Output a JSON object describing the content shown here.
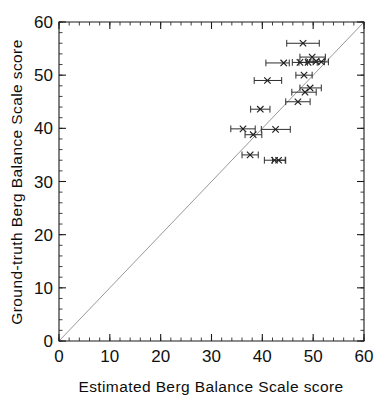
{
  "figure": {
    "background_color": "#ffffff",
    "frame_color": "#1a1a1a",
    "identity_line_color": "#8c8c8c",
    "marker_color": "#1f1f1f",
    "errorbar_color": "#2e2e2e"
  },
  "chart_data": {
    "type": "scatter",
    "title": "",
    "xlabel": "Estimated Berg Balance Scale score",
    "ylabel": "Ground-truth Berg Balance Scale score",
    "xlim": [
      0,
      60
    ],
    "ylim": [
      0,
      60
    ],
    "xticks": [
      0,
      10,
      20,
      30,
      40,
      50,
      60
    ],
    "yticks": [
      0,
      10,
      20,
      30,
      40,
      50,
      60
    ],
    "xtick_labels": [
      "0",
      "10",
      "20",
      "30",
      "40",
      "50",
      "60"
    ],
    "ytick_labels": [
      "0",
      "10",
      "20",
      "30",
      "40",
      "50",
      "60"
    ],
    "minor_tick_interval": 2,
    "grid": false,
    "legend": null,
    "reference_line": {
      "name": "identity-line",
      "type": "line",
      "from": [
        0,
        0
      ],
      "to": [
        60,
        60
      ],
      "label": "y = x"
    },
    "error_bar_orientation": "horizontal",
    "series": [
      {
        "name": "participants",
        "marker": "x",
        "points": [
          {
            "x": 48.0,
            "y": 56.0,
            "xerr_low": 3.2,
            "xerr_high": 3.2
          },
          {
            "x": 49.8,
            "y": 53.4,
            "xerr_low": 2.4,
            "xerr_high": 2.6
          },
          {
            "x": 50.6,
            "y": 52.6,
            "xerr_low": 2.0,
            "xerr_high": 1.6
          },
          {
            "x": 51.6,
            "y": 52.5,
            "xerr_low": 1.6,
            "xerr_high": 1.4
          },
          {
            "x": 49.0,
            "y": 52.4,
            "xerr_low": 1.8,
            "xerr_high": 1.8
          },
          {
            "x": 47.4,
            "y": 52.4,
            "xerr_low": 1.5,
            "xerr_high": 1.5
          },
          {
            "x": 44.2,
            "y": 52.3,
            "xerr_low": 3.5,
            "xerr_high": 1.1
          },
          {
            "x": 48.2,
            "y": 50.0,
            "xerr_low": 1.6,
            "xerr_high": 1.6
          },
          {
            "x": 41.0,
            "y": 49.0,
            "xerr_low": 2.6,
            "xerr_high": 2.8
          },
          {
            "x": 49.4,
            "y": 47.6,
            "xerr_low": 2.0,
            "xerr_high": 2.2
          },
          {
            "x": 48.4,
            "y": 46.8,
            "xerr_low": 2.6,
            "xerr_high": 2.2
          },
          {
            "x": 47.0,
            "y": 45.0,
            "xerr_low": 2.4,
            "xerr_high": 2.4
          },
          {
            "x": 39.6,
            "y": 43.6,
            "xerr_low": 1.9,
            "xerr_high": 1.9
          },
          {
            "x": 36.2,
            "y": 39.9,
            "xerr_low": 2.4,
            "xerr_high": 2.4
          },
          {
            "x": 42.6,
            "y": 39.8,
            "xerr_low": 2.8,
            "xerr_high": 2.9
          },
          {
            "x": 38.2,
            "y": 38.8,
            "xerr_low": 1.6,
            "xerr_high": 1.7
          },
          {
            "x": 37.6,
            "y": 35.0,
            "xerr_low": 1.6,
            "xerr_high": 1.6
          },
          {
            "x": 42.4,
            "y": 34.0,
            "xerr_low": 2.0,
            "xerr_high": 2.1
          },
          {
            "x": 43.2,
            "y": 34.0,
            "xerr_low": 1.2,
            "xerr_high": 1.4
          }
        ]
      }
    ]
  }
}
